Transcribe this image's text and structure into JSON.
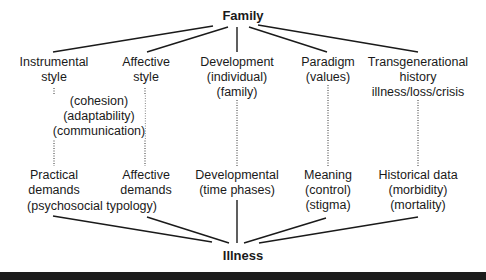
{
  "diagram": {
    "top_node": "Family",
    "bottom_node": "Illness",
    "upper_nodes": [
      {
        "lines": [
          "Instrumental",
          "style"
        ]
      },
      {
        "lines": [
          "Affective",
          "style"
        ]
      },
      {
        "lines": [
          "Development",
          "(individual)",
          "(family)"
        ]
      },
      {
        "lines": [
          "Paradigm",
          "(values)"
        ]
      },
      {
        "lines": [
          "Transgenerational",
          "history",
          "illness/loss/crisis"
        ]
      }
    ],
    "middle_annotation": [
      "(cohesion)",
      "(adaptability)",
      "(communication)"
    ],
    "lower_nodes": [
      {
        "lines": [
          "Practical",
          "demands"
        ]
      },
      {
        "lines": [
          "Affective",
          "demands"
        ]
      },
      {
        "lines": [
          "Developmental",
          "(time phases)"
        ]
      },
      {
        "lines": [
          "Meaning",
          "(control)",
          "(stigma)"
        ]
      },
      {
        "lines": [
          "Historical data",
          "(morbidity)",
          "(mortality)"
        ]
      }
    ],
    "lower_annotation": "(psychosocial typology)",
    "line_color": "#1a1a1a"
  }
}
